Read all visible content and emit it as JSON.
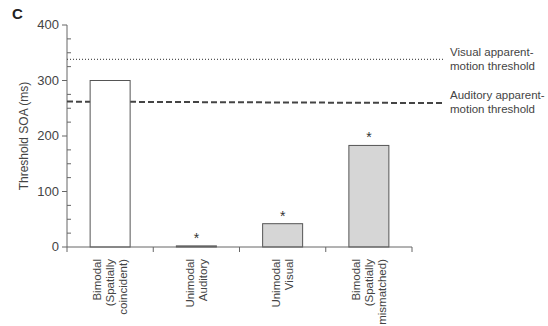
{
  "panel_label": "C",
  "chart_data": {
    "type": "bar",
    "title": "",
    "xlabel": "",
    "ylabel": "Threshold SOA (ms)",
    "ylim": [
      0,
      400
    ],
    "yticks": [
      0,
      100,
      200,
      300,
      400
    ],
    "grid": false,
    "categories": [
      [
        "Bimodal",
        "(Spatially",
        "coincident)"
      ],
      [
        "Unimodal",
        "Auditory"
      ],
      [
        "Unimodal",
        "Visual"
      ],
      [
        "Bimodal",
        "(Spatially",
        "mismatched)"
      ]
    ],
    "values": [
      300,
      2,
      42,
      183
    ],
    "significance": [
      false,
      true,
      true,
      true
    ],
    "significance_marker": "*",
    "bar_fills": [
      "#ffffff",
      "#d6d6d6",
      "#d6d6d6",
      "#d6d6d6"
    ],
    "reference_lines": [
      {
        "name": "Visual apparent-motion threshold",
        "label_lines": [
          "Visual apparent-",
          "motion threshold"
        ],
        "value": 338,
        "style": "dotted"
      },
      {
        "name": "Auditory apparent-motion threshold",
        "label_lines": [
          "Auditory apparent-",
          "motion threshold"
        ],
        "value": 262,
        "style": "dashed"
      }
    ]
  }
}
